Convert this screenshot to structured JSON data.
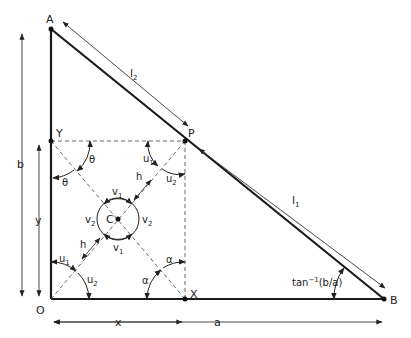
{
  "diagram": {
    "points": {
      "A": {
        "label": "A"
      },
      "B": {
        "label": "B"
      },
      "O": {
        "label": "O"
      },
      "P": {
        "label": "P"
      },
      "X": {
        "label": "X"
      },
      "Y": {
        "label": "Y"
      },
      "C": {
        "label": "C"
      }
    },
    "dimensions": {
      "b": "b",
      "y": "y",
      "x": "x",
      "a": "a",
      "l1": "l",
      "l1_sub": "1",
      "l2": "l",
      "l2_sub": "2"
    },
    "angles": {
      "theta": "θ",
      "alpha": "α",
      "u": "u",
      "v": "v",
      "h": "h",
      "sub1": "1",
      "sub2": "2",
      "tan_base": "tan",
      "tan_sup": "−1",
      "tan_arg": "(b/a)"
    },
    "colors": {
      "line": "#1a1a1a",
      "dashed": "#555555",
      "background": "#ffffff"
    }
  }
}
